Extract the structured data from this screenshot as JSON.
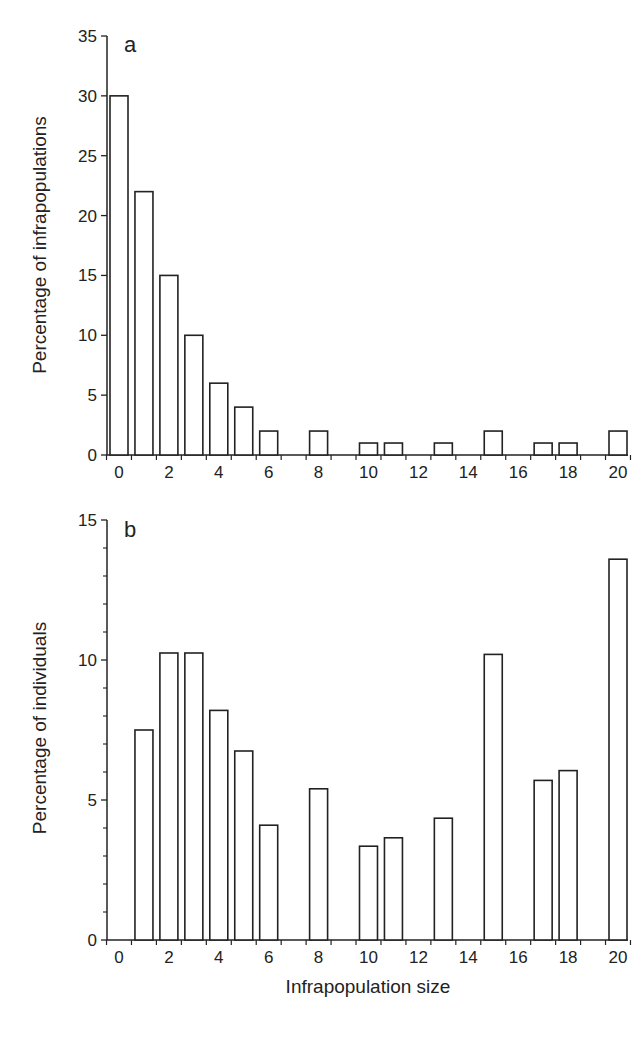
{
  "chart_data": [
    {
      "type": "bar",
      "panel_label": "a",
      "title": "",
      "xlabel": "",
      "ylabel": "Percentage of infrapopulations",
      "ylim": [
        0,
        35
      ],
      "yticks": [
        0,
        5,
        10,
        15,
        20,
        25,
        30,
        35
      ],
      "xticks": [
        0,
        2,
        4,
        6,
        8,
        10,
        12,
        14,
        16,
        18,
        20
      ],
      "grid": false,
      "categories": [
        0,
        1,
        2,
        3,
        4,
        5,
        6,
        8,
        10,
        11,
        13,
        15,
        17,
        18,
        20
      ],
      "values": [
        30,
        22,
        15,
        10,
        6,
        4,
        2,
        2,
        1,
        1,
        1,
        2,
        1,
        1,
        2
      ]
    },
    {
      "type": "bar",
      "panel_label": "b",
      "title": "",
      "xlabel": "Infrapopulation size",
      "ylabel": "Percentage of individuals",
      "ylim": [
        0,
        15
      ],
      "yticks": [
        0,
        5,
        10,
        15
      ],
      "xticks": [
        0,
        2,
        4,
        6,
        8,
        10,
        12,
        14,
        16,
        18,
        20
      ],
      "grid": false,
      "categories": [
        1,
        2,
        3,
        4,
        5,
        6,
        8,
        10,
        11,
        13,
        15,
        17,
        18,
        20
      ],
      "values": [
        7.5,
        10.25,
        10.25,
        8.2,
        6.75,
        4.1,
        5.4,
        3.35,
        3.65,
        4.35,
        10.2,
        5.7,
        6.05,
        13.6
      ]
    }
  ]
}
